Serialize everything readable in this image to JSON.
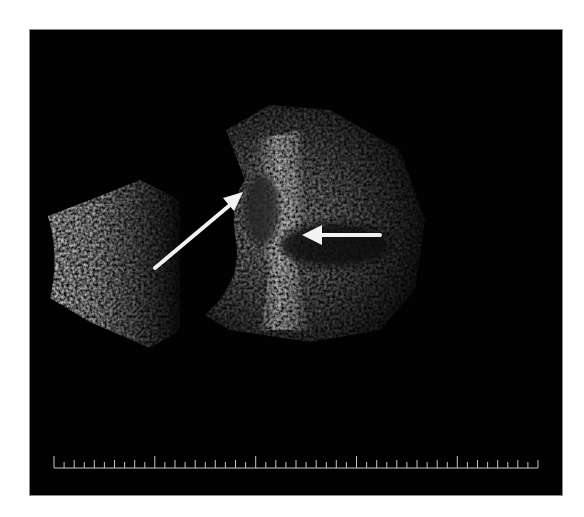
{
  "image": {
    "type": "ocular B-scan ultrasound",
    "background_color": "#020202",
    "page_color": "#ffffff"
  },
  "annotations": {
    "arrows": [
      {
        "name": "diagonal-arrow",
        "direction": "up-right",
        "color": "#f2f2f2"
      },
      {
        "name": "horizontal-arrow",
        "direction": "left",
        "color": "#f2f2f2"
      }
    ]
  },
  "scale_bar": {
    "color": "#c8c8c8",
    "tick_count": 49,
    "major_tick_every": 10
  }
}
